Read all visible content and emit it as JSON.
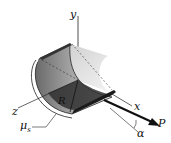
{
  "diagram": {
    "labels": {
      "y_axis": "y",
      "x_axis": "x",
      "z_axis": "z",
      "radius": "R",
      "friction": "μs",
      "friction_main": "μ",
      "friction_sub": "s",
      "force": "P",
      "angle": "α"
    }
  }
}
